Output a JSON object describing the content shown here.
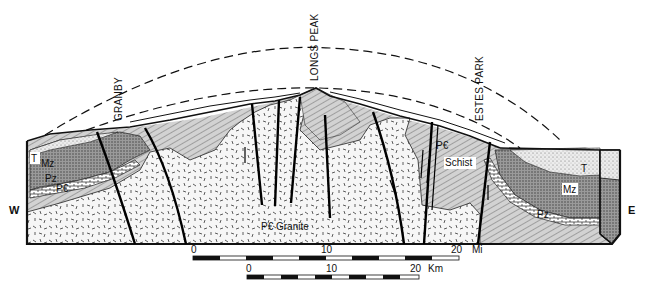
{
  "diagram": {
    "type": "geologic-cross-section",
    "orientation": {
      "left": "W",
      "right": "E"
    },
    "place_labels": [
      {
        "id": "granby",
        "text": "GRANBY"
      },
      {
        "id": "longs_peak",
        "text": "LONGS PEAK"
      },
      {
        "id": "estes_park",
        "text": "ESTES PARK"
      }
    ],
    "units": {
      "tertiary": "T",
      "mesozoic": "Mz",
      "paleozoic": "Pz",
      "precambrian": "P€",
      "granite": "P€ Granite",
      "schist_pc": "P€",
      "schist": "Schist"
    },
    "colors": {
      "line": "#111111",
      "schist_fill": "#c9c9c9",
      "mesozoic_fill": "#8a8a8a",
      "tertiary_fill": "#e2e2e2",
      "granite_fill": "#f4f4f4",
      "background": "#ffffff"
    }
  },
  "scale_bars": {
    "miles": {
      "ticks": [
        "0",
        "10",
        "20"
      ],
      "unit": "Mi"
    },
    "km": {
      "ticks": [
        "0",
        "10",
        "20"
      ],
      "unit": "Km"
    }
  }
}
